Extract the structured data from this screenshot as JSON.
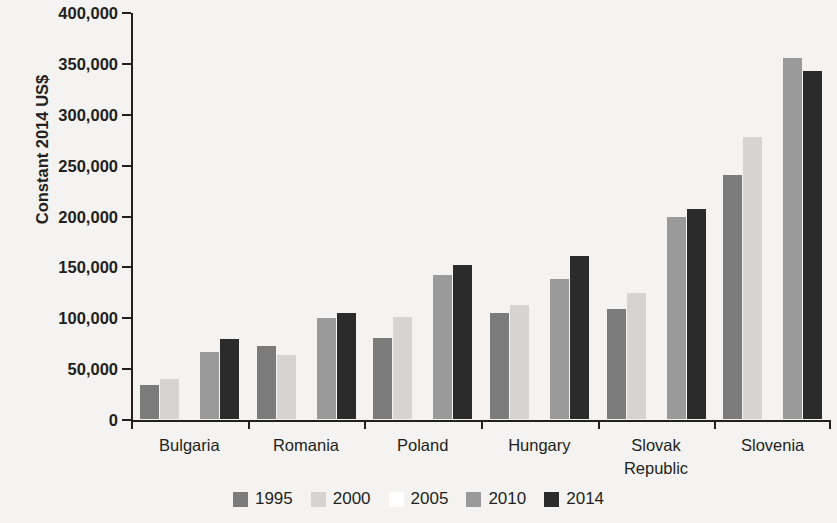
{
  "chart_data": {
    "type": "bar",
    "title": "",
    "subtitle": "",
    "xlabel": "",
    "ylabel": "Constant 2014 US$",
    "ylim": [
      0,
      400000
    ],
    "ytick_step": 50000,
    "yticks": [
      0,
      50000,
      100000,
      150000,
      200000,
      250000,
      300000,
      350000,
      400000
    ],
    "ytick_labels": [
      "0",
      "50,000",
      "100,000",
      "150,000",
      "200,000",
      "250,000",
      "300,000",
      "350,000",
      "400,000"
    ],
    "grid": false,
    "legend_position": "bottom",
    "categories": [
      "Bulgaria",
      "Romania",
      "Poland",
      "Hungary",
      "Slovak Republic",
      "Slovenia"
    ],
    "series": [
      {
        "name": "1995",
        "color": "#7b7b7b",
        "values": [
          33000,
          72000,
          80000,
          104000,
          108000,
          240000
        ]
      },
      {
        "name": "2000",
        "color": "#d5d4d2",
        "values": [
          39000,
          63000,
          100000,
          112000,
          124000,
          277000
        ]
      },
      {
        "name": "2005",
        "color": "#ffffff",
        "values": [
          null,
          null,
          null,
          null,
          null,
          null
        ]
      },
      {
        "name": "2010",
        "color": "#9a9a9a",
        "values": [
          66000,
          99000,
          142000,
          138000,
          199000,
          355000
        ]
      },
      {
        "name": "2014",
        "color": "#2b2b2b",
        "values": [
          79000,
          104000,
          151000,
          160000,
          206000,
          342000
        ]
      }
    ]
  },
  "axis": {
    "y_title": "Constant 2014 US$"
  }
}
